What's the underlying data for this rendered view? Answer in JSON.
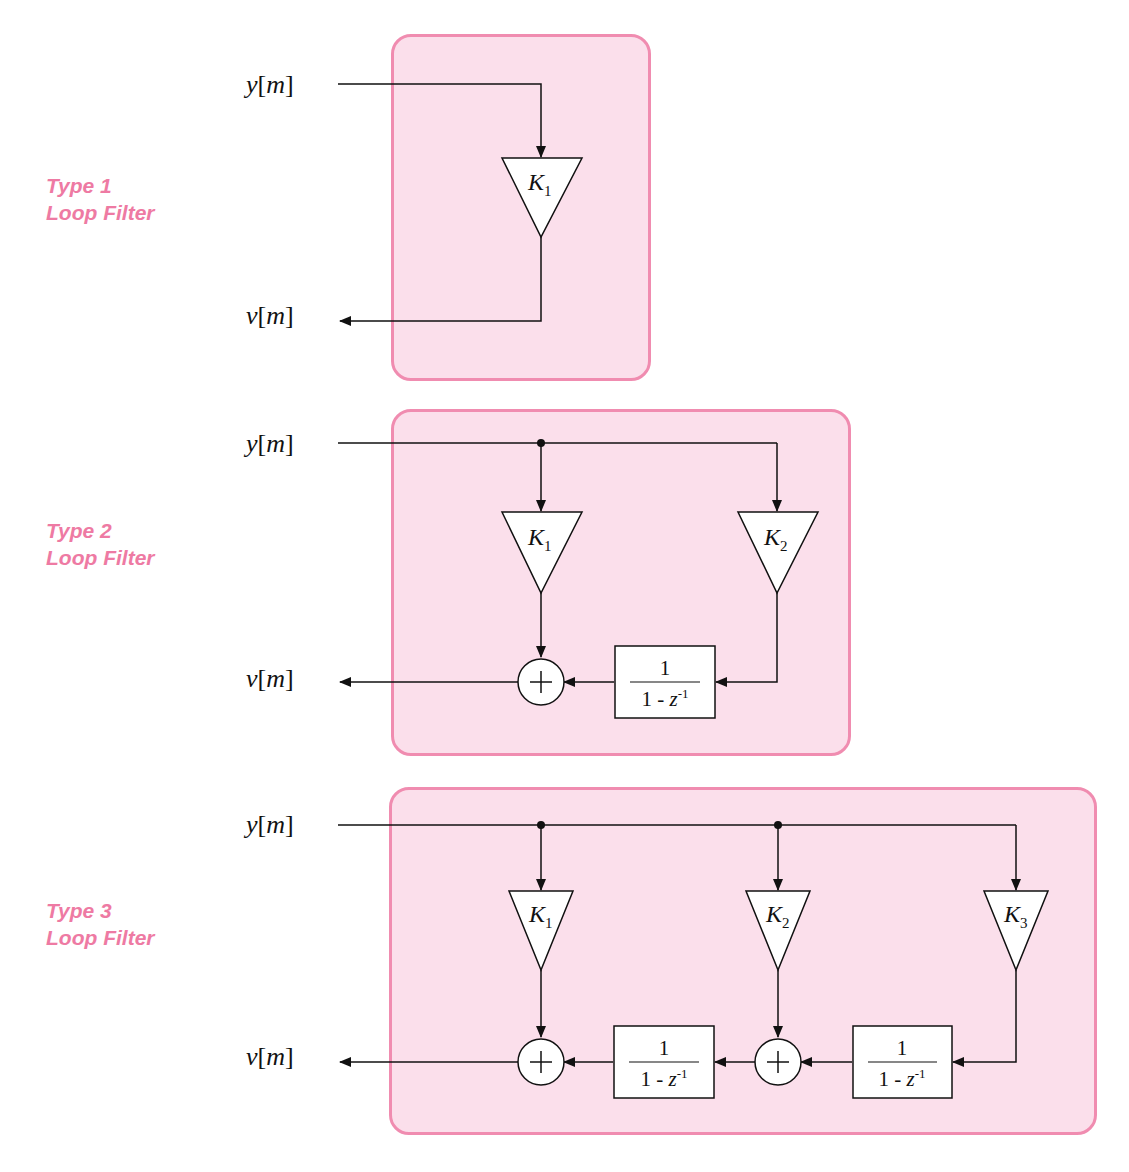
{
  "colors": {
    "panel_fill": "#fbdfeb",
    "panel_border": "#f08cb0",
    "label_color": "#ee7aa3",
    "line_color": "#111111"
  },
  "filters": [
    {
      "title_line1": "Type 1",
      "title_line2": "Loop Filter",
      "input": {
        "var": "y",
        "idx": "m"
      },
      "output": {
        "var": "v",
        "idx": "m"
      },
      "gains": [
        {
          "symbol": "K",
          "sub": "1"
        }
      ],
      "integrators": []
    },
    {
      "title_line1": "Type 2",
      "title_line2": "Loop Filter",
      "input": {
        "var": "y",
        "idx": "m"
      },
      "output": {
        "var": "v",
        "idx": "m"
      },
      "gains": [
        {
          "symbol": "K",
          "sub": "1"
        },
        {
          "symbol": "K",
          "sub": "2"
        }
      ],
      "summers": [
        "+"
      ],
      "integrators": [
        {
          "numerator": "1",
          "denominator_pre": "1 - ",
          "denominator_var": "z",
          "denominator_exp": "-1"
        }
      ]
    },
    {
      "title_line1": "Type 3",
      "title_line2": "Loop Filter",
      "input": {
        "var": "y",
        "idx": "m"
      },
      "output": {
        "var": "v",
        "idx": "m"
      },
      "gains": [
        {
          "symbol": "K",
          "sub": "1"
        },
        {
          "symbol": "K",
          "sub": "2"
        },
        {
          "symbol": "K",
          "sub": "3"
        }
      ],
      "summers": [
        "+",
        "+"
      ],
      "integrators": [
        {
          "numerator": "1",
          "denominator_pre": "1 - ",
          "denominator_var": "z",
          "denominator_exp": "-1"
        },
        {
          "numerator": "1",
          "denominator_pre": "1 - ",
          "denominator_var": "z",
          "denominator_exp": "-1"
        }
      ]
    }
  ]
}
